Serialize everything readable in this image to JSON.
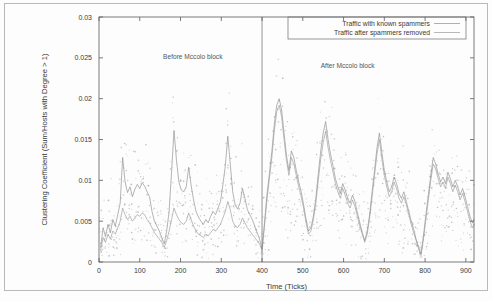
{
  "chart_data": {
    "type": "line",
    "title": "",
    "xlabel": "Time (Ticks)",
    "ylabel": "Clustering Coefficient (Sum/Hosts with Degree > 1)",
    "xlim": [
      0,
      920
    ],
    "ylim": [
      0,
      0.03
    ],
    "xticks": [
      0,
      100,
      200,
      300,
      400,
      500,
      600,
      700,
      800,
      900
    ],
    "yticks": [
      0,
      0.005,
      0.01,
      0.015,
      0.02,
      0.025,
      0.03
    ],
    "xtick_labels": [
      "0",
      "100",
      "200",
      "300",
      "400",
      "500",
      "600",
      "700",
      "800",
      "900"
    ],
    "ytick_labels": [
      "0",
      "0.005",
      "0.01",
      "0.015",
      "0.02",
      "0.025",
      "0.03"
    ],
    "grid": false,
    "legend_position": "top-right",
    "legend": [
      "Traffic with known spammers",
      "Traffic after spammers removed"
    ],
    "annotations": [
      {
        "text": "Before Mccolo block",
        "x": 230,
        "y": 0.0248
      },
      {
        "text": "After Mccolo block",
        "x": 610,
        "y": 0.0238
      }
    ],
    "vertical_marker": {
      "x": 400,
      "label": "Mccolo block"
    },
    "colors": {
      "series_with_spammers": "#8c8c8c",
      "series_after_removed": "#9a9a9a",
      "scatter": "#b5b5b5",
      "axis": "#5a5a5a",
      "frame": "#b9b9b9"
    },
    "series": [
      {
        "name": "Traffic with known spammers",
        "x": [
          4,
          10,
          16,
          22,
          28,
          34,
          40,
          46,
          52,
          58,
          64,
          70,
          76,
          82,
          88,
          94,
          100,
          106,
          112,
          118,
          124,
          130,
          136,
          142,
          148,
          154,
          160,
          166,
          172,
          178,
          184,
          190,
          196,
          202,
          208,
          214,
          220,
          226,
          232,
          238,
          244,
          250,
          256,
          262,
          268,
          274,
          280,
          286,
          292,
          298,
          304,
          310,
          316,
          322,
          328,
          334,
          340,
          346,
          352,
          358,
          364,
          370,
          376,
          382,
          388,
          394,
          400,
          406,
          412,
          418,
          424,
          430,
          436,
          442,
          448,
          454,
          460,
          466,
          472,
          478,
          484,
          490,
          496,
          502,
          508,
          514,
          520,
          526,
          532,
          538,
          544,
          550,
          556,
          562,
          568,
          574,
          580,
          586,
          592,
          598,
          604,
          610,
          616,
          622,
          628,
          634,
          640,
          646,
          652,
          658,
          664,
          670,
          676,
          682,
          688,
          694,
          700,
          706,
          712,
          718,
          724,
          730,
          736,
          742,
          748,
          754,
          760,
          766,
          772,
          778,
          784,
          790,
          796,
          802,
          808,
          814,
          820,
          826,
          832,
          838,
          844,
          850,
          856,
          862,
          868,
          874,
          880,
          886,
          892,
          898,
          904,
          910,
          916,
          920
        ],
        "values": [
          0.0018,
          0.0042,
          0.0031,
          0.0046,
          0.0036,
          0.0052,
          0.0044,
          0.0058,
          0.0072,
          0.0128,
          0.0098,
          0.0085,
          0.0092,
          0.008,
          0.0089,
          0.0095,
          0.009,
          0.0097,
          0.0093,
          0.0086,
          0.008,
          0.0062,
          0.005,
          0.0044,
          0.0038,
          0.003,
          0.0022,
          0.0038,
          0.0062,
          0.011,
          0.0161,
          0.0125,
          0.0098,
          0.0088,
          0.0086,
          0.0092,
          0.0116,
          0.0094,
          0.0076,
          0.0062,
          0.0055,
          0.005,
          0.0046,
          0.0052,
          0.0048,
          0.0056,
          0.0062,
          0.0058,
          0.0066,
          0.0074,
          0.0095,
          0.0118,
          0.0154,
          0.012,
          0.0086,
          0.007,
          0.0065,
          0.0072,
          0.009,
          0.0078,
          0.0064,
          0.0058,
          0.0052,
          0.0044,
          0.0036,
          0.0028,
          0.0016,
          0.0048,
          0.0082,
          0.0108,
          0.0135,
          0.0168,
          0.0192,
          0.02,
          0.0186,
          0.0158,
          0.013,
          0.0112,
          0.0136,
          0.0128,
          0.0112,
          0.0098,
          0.0086,
          0.007,
          0.0052,
          0.0038,
          0.0042,
          0.0056,
          0.0078,
          0.0108,
          0.0136,
          0.0158,
          0.0172,
          0.015,
          0.0132,
          0.0118,
          0.0102,
          0.0092,
          0.0084,
          0.0096,
          0.0088,
          0.0078,
          0.0072,
          0.0082,
          0.0074,
          0.006,
          0.0048,
          0.0036,
          0.0026,
          0.0038,
          0.0058,
          0.0086,
          0.0112,
          0.014,
          0.0158,
          0.0134,
          0.0112,
          0.0098,
          0.0086,
          0.0092,
          0.0104,
          0.0096,
          0.0084,
          0.0078,
          0.0086,
          0.0074,
          0.0062,
          0.005,
          0.004,
          0.0028,
          0.0018,
          0.001,
          0.0032,
          0.0058,
          0.0082,
          0.0106,
          0.0128,
          0.012,
          0.0108,
          0.0098,
          0.0104,
          0.0096,
          0.011,
          0.0102,
          0.0092,
          0.01,
          0.0092,
          0.0082,
          0.009,
          0.008,
          0.0068,
          0.0056,
          0.0048,
          0.0052
        ]
      },
      {
        "name": "Traffic after spammers removed",
        "x": [
          4,
          10,
          16,
          22,
          28,
          34,
          40,
          46,
          52,
          58,
          64,
          70,
          76,
          82,
          88,
          94,
          100,
          106,
          112,
          118,
          124,
          130,
          136,
          142,
          148,
          154,
          160,
          166,
          172,
          178,
          184,
          190,
          196,
          202,
          208,
          214,
          220,
          226,
          232,
          238,
          244,
          250,
          256,
          262,
          268,
          274,
          280,
          286,
          292,
          298,
          304,
          310,
          316,
          322,
          328,
          334,
          340,
          346,
          352,
          358,
          364,
          370,
          376,
          382,
          388,
          394,
          400,
          406,
          412,
          418,
          424,
          430,
          436,
          442,
          448,
          454,
          460,
          466,
          472,
          478,
          484,
          490,
          496,
          502,
          508,
          514,
          520,
          526,
          532,
          538,
          544,
          550,
          556,
          562,
          568,
          574,
          580,
          586,
          592,
          598,
          604,
          610,
          616,
          622,
          628,
          634,
          640,
          646,
          652,
          658,
          664,
          670,
          676,
          682,
          688,
          694,
          700,
          706,
          712,
          718,
          724,
          730,
          736,
          742,
          748,
          754,
          760,
          766,
          772,
          778,
          784,
          790,
          796,
          802,
          808,
          814,
          820,
          826,
          832,
          838,
          844,
          850,
          856,
          862,
          868,
          874,
          880,
          886,
          892,
          898,
          904,
          910,
          916,
          920
        ],
        "values": [
          0.0014,
          0.003,
          0.0024,
          0.0034,
          0.0028,
          0.0038,
          0.0034,
          0.0042,
          0.005,
          0.0066,
          0.0058,
          0.0052,
          0.0056,
          0.005,
          0.0054,
          0.0058,
          0.0056,
          0.006,
          0.0058,
          0.0052,
          0.0048,
          0.0042,
          0.0036,
          0.0032,
          0.0028,
          0.0024,
          0.0018,
          0.0026,
          0.0038,
          0.0052,
          0.0066,
          0.0058,
          0.0052,
          0.0048,
          0.0046,
          0.005,
          0.006,
          0.0052,
          0.0044,
          0.0038,
          0.0034,
          0.0032,
          0.003,
          0.0034,
          0.0032,
          0.0036,
          0.004,
          0.0038,
          0.0042,
          0.0046,
          0.0054,
          0.0062,
          0.0074,
          0.0064,
          0.005,
          0.0044,
          0.0042,
          0.0046,
          0.0054,
          0.0048,
          0.0042,
          0.0038,
          0.0034,
          0.003,
          0.0026,
          0.0022,
          0.0014,
          0.0044,
          0.0076,
          0.0102,
          0.0128,
          0.016,
          0.0184,
          0.0192,
          0.0178,
          0.015,
          0.0124,
          0.0106,
          0.0128,
          0.012,
          0.0106,
          0.0092,
          0.008,
          0.0066,
          0.0048,
          0.0034,
          0.0038,
          0.0052,
          0.0072,
          0.01,
          0.0126,
          0.0146,
          0.016,
          0.014,
          0.0124,
          0.011,
          0.0096,
          0.0086,
          0.0078,
          0.009,
          0.0082,
          0.0072,
          0.0066,
          0.0076,
          0.0068,
          0.0056,
          0.0044,
          0.0034,
          0.0024,
          0.0034,
          0.0054,
          0.008,
          0.0106,
          0.0132,
          0.015,
          0.0126,
          0.0106,
          0.0092,
          0.008,
          0.0086,
          0.0098,
          0.009,
          0.0078,
          0.0072,
          0.008,
          0.007,
          0.0058,
          0.0046,
          0.0036,
          0.0026,
          0.0016,
          0.0008,
          0.0028,
          0.0052,
          0.0076,
          0.01,
          0.012,
          0.0114,
          0.0102,
          0.0092,
          0.0098,
          0.009,
          0.0104,
          0.0096,
          0.0086,
          0.0094,
          0.0086,
          0.0076,
          0.0084,
          0.0074,
          0.0062,
          0.005,
          0.0042,
          0.0046
        ]
      }
    ],
    "scatter_note": "dense light-gray point cloud scattered around both series across full x-range"
  }
}
